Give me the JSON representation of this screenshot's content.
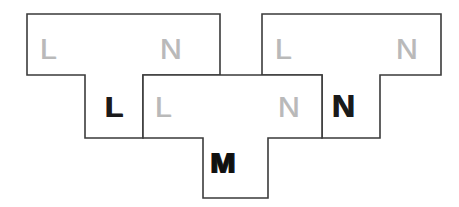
{
  "image": {
    "kind": "scanned-line-diagram",
    "width": 459,
    "height": 207,
    "background_color": "#ffffff",
    "stroke_color": "#3b3b3b",
    "stroke_width": 1.6
  },
  "palette": {
    "faint_letter_color": "#b9b9b9",
    "bold_letter_color": "#1a1a1a",
    "outline_color": "#3b3b3b",
    "fill_color": "#ffffff"
  },
  "shapes": [
    {
      "id": "left-polygon",
      "name": "left-t-polygon",
      "description": "T-shaped outline: wide upper bar on the left with a narrower arm stepping down and right",
      "points": "27,14 220,14 220,75 143,75 143,138 85,138 85,75 27,75"
    },
    {
      "id": "right-polygon",
      "name": "right-t-polygon",
      "description": "T-shaped outline: wide upper bar on the right with a narrower arm stepping down and left",
      "points": "262,14 441,14 441,75 380,75 380,138 322,138 322,75 262,75"
    },
    {
      "id": "center-polygon",
      "name": "center-t-polygon",
      "description": "Central T-shaped outline: wide middle bar with a tab descending at the bottom center",
      "points": "143,75 322,75 322,138 268,138 268,198 203,198 203,138 143,138"
    }
  ],
  "labels": [
    {
      "id": "label-top-left-l",
      "name": "region-label-L-top-left",
      "text": "L",
      "style": "faint",
      "x": 40,
      "y": 34,
      "size": 30
    },
    {
      "id": "label-top-left-n",
      "name": "region-label-N-top-left",
      "text": "N",
      "style": "faint",
      "x": 160,
      "y": 34,
      "size": 30
    },
    {
      "id": "label-top-right-l",
      "name": "region-label-L-top-right",
      "text": "L",
      "style": "faint",
      "x": 275,
      "y": 34,
      "size": 30
    },
    {
      "id": "label-top-right-n",
      "name": "region-label-N-top-right",
      "text": "N",
      "style": "faint",
      "x": 396,
      "y": 34,
      "size": 30
    },
    {
      "id": "label-mid-left-l",
      "name": "region-label-L-mid-left",
      "text": "L",
      "style": "bold",
      "x": 105,
      "y": 92,
      "size": 30
    },
    {
      "id": "label-mid-center-l",
      "name": "region-label-L-mid-center",
      "text": "L",
      "style": "faint",
      "x": 155,
      "y": 92,
      "size": 30
    },
    {
      "id": "label-mid-center-n",
      "name": "region-label-N-mid-center",
      "text": "N",
      "style": "faint",
      "x": 278,
      "y": 92,
      "size": 30
    },
    {
      "id": "label-mid-right-n",
      "name": "region-label-N-mid-right",
      "text": "N",
      "style": "bold",
      "x": 332,
      "y": 90,
      "size": 32
    },
    {
      "id": "label-bottom-m",
      "name": "region-label-M-bottom",
      "text": "M",
      "style": "m",
      "x": 210,
      "y": 148,
      "size": 30
    }
  ]
}
